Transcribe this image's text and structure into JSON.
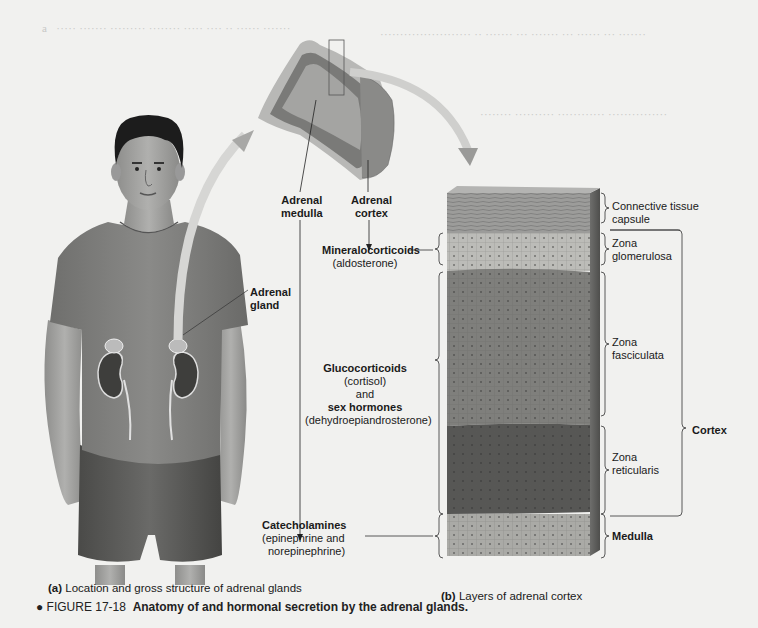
{
  "figure": {
    "number": "FIGURE 17-18",
    "title": "Anatomy of and hormonal secretion by the adrenal glands.",
    "bullet": "●"
  },
  "panel_a": {
    "letter": "(a)",
    "caption": "Location and gross structure of adrenal glands",
    "labels": {
      "adrenal_gland": [
        "Adrenal",
        "gland"
      ],
      "adrenal_medulla": [
        "Adrenal",
        "medulla"
      ],
      "adrenal_cortex": [
        "Adrenal",
        "cortex"
      ]
    }
  },
  "hormones": {
    "mineralocorticoids": {
      "name": "Mineralocorticoids",
      "example": "(aldosterone)"
    },
    "glucocorticoids": {
      "name": "Glucocorticoids",
      "example": "(cortisol)",
      "conj": "and",
      "name2": "sex hormones",
      "example2": "(dehydroepiandrosterone)"
    },
    "catecholamines": {
      "name": "Catecholamines",
      "example": "(epinephrine and",
      "example_line2": "norepinephrine)"
    }
  },
  "panel_b": {
    "letter": "(b)",
    "caption": "Layers of adrenal cortex",
    "layers": [
      {
        "lines": [
          "Connective tissue",
          "capsule"
        ]
      },
      {
        "lines": [
          "Zona",
          "glomerulosa"
        ]
      },
      {
        "lines": [
          "Zona",
          "fasciculata"
        ]
      },
      {
        "lines": [
          "Zona",
          "reticularis"
        ]
      },
      {
        "lines": [
          "Medulla"
        ],
        "bold": true
      }
    ],
    "group_label": "Cortex"
  },
  "colors": {
    "page": "#f1f1ef",
    "capsule": "#9a9a98",
    "glomerulosa": "#b8b8b4",
    "fasciculata": "#7d7d7a",
    "reticularis": "#555553",
    "medulla": "#a9a9a6",
    "arrow": "#a3a3a1"
  }
}
